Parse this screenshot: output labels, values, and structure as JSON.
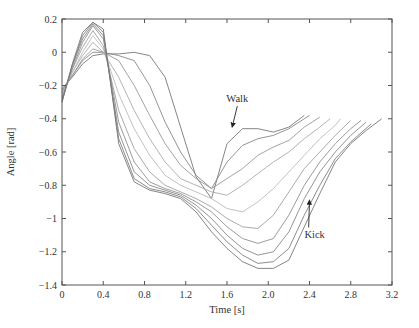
{
  "chart_data": {
    "type": "line",
    "title": "",
    "xlabel": "Time [s]",
    "ylabel": "Angle [rad]",
    "xlim": [
      0,
      3.2
    ],
    "ylim": [
      -1.4,
      0.2
    ],
    "xticks": [
      0,
      0.4,
      0.8,
      1.2,
      1.6,
      2.0,
      2.4,
      2.8,
      3.2
    ],
    "xtick_labels": [
      "0",
      "0.4",
      "0.8",
      "1.2",
      "1.6",
      "2.0",
      "2.4",
      "2.8",
      "3.2"
    ],
    "yticks": [
      0.2,
      0,
      -0.2,
      -0.4,
      -0.6,
      -0.8,
      -1,
      -1.2,
      -1.4
    ],
    "ytick_labels": [
      "0.2",
      "0",
      "−0.2",
      "−0.4",
      "−0.6",
      "−0.8",
      "−1",
      "−1.2",
      "−1.4"
    ],
    "grid": false,
    "legend": null,
    "line_color": "#8a8a8a",
    "annotations": [
      {
        "text": "Walk",
        "x_text": 1.7,
        "y_text": -0.3,
        "arrow_to": [
          1.65,
          -0.45
        ]
      },
      {
        "text": "Kick",
        "x_text": 2.45,
        "y_text": -1.12,
        "arrow_to": [
          2.4,
          -0.89
        ]
      }
    ],
    "series": [
      {
        "name": "Walk",
        "x": [
          0,
          0.1,
          0.2,
          0.3,
          0.4,
          0.55,
          0.7,
          0.85,
          1.0,
          1.15,
          1.3,
          1.45,
          1.6,
          1.75,
          1.9,
          2.05,
          2.2,
          2.35
        ],
        "y": [
          -0.22,
          -0.15,
          -0.07,
          -0.02,
          -0.01,
          -0.01,
          0.0,
          -0.02,
          -0.15,
          -0.45,
          -0.75,
          -0.88,
          -0.55,
          -0.46,
          -0.46,
          -0.48,
          -0.45,
          -0.38
        ]
      },
      {
        "name": "trial-2",
        "x": [
          0,
          0.1,
          0.2,
          0.3,
          0.4,
          0.55,
          0.7,
          0.85,
          1.0,
          1.15,
          1.3,
          1.45,
          1.6,
          1.75,
          1.9,
          2.05,
          2.2,
          2.4
        ],
        "y": [
          -0.23,
          -0.14,
          -0.05,
          0.0,
          0.0,
          -0.02,
          -0.05,
          -0.2,
          -0.42,
          -0.6,
          -0.74,
          -0.82,
          -0.66,
          -0.56,
          -0.52,
          -0.5,
          -0.46,
          -0.38
        ]
      },
      {
        "name": "trial-3",
        "x": [
          0,
          0.1,
          0.2,
          0.3,
          0.4,
          0.55,
          0.7,
          0.85,
          1.0,
          1.15,
          1.3,
          1.45,
          1.6,
          1.75,
          1.9,
          2.05,
          2.2,
          2.35,
          2.5
        ],
        "y": [
          -0.24,
          -0.14,
          -0.04,
          0.02,
          0.0,
          -0.05,
          -0.2,
          -0.38,
          -0.55,
          -0.68,
          -0.76,
          -0.82,
          -0.76,
          -0.7,
          -0.62,
          -0.57,
          -0.53,
          -0.45,
          -0.39
        ]
      },
      {
        "name": "trial-4",
        "x": [
          0,
          0.1,
          0.2,
          0.3,
          0.4,
          0.55,
          0.7,
          0.85,
          1.0,
          1.15,
          1.3,
          1.45,
          1.6,
          1.75,
          1.9,
          2.05,
          2.2,
          2.35,
          2.5,
          2.6
        ],
        "y": [
          -0.25,
          -0.12,
          -0.02,
          0.06,
          0.0,
          -0.15,
          -0.35,
          -0.52,
          -0.66,
          -0.76,
          -0.8,
          -0.84,
          -0.86,
          -0.8,
          -0.73,
          -0.66,
          -0.6,
          -0.52,
          -0.45,
          -0.4
        ]
      },
      {
        "name": "trial-5",
        "x": [
          0,
          0.1,
          0.2,
          0.3,
          0.4,
          0.55,
          0.7,
          0.85,
          1.0,
          1.15,
          1.3,
          1.45,
          1.6,
          1.75,
          1.9,
          2.05,
          2.2,
          2.35,
          2.5,
          2.65,
          2.7
        ],
        "y": [
          -0.26,
          -0.12,
          0.0,
          0.1,
          0.02,
          -0.25,
          -0.46,
          -0.62,
          -0.74,
          -0.8,
          -0.84,
          -0.88,
          -0.94,
          -0.96,
          -0.9,
          -0.82,
          -0.72,
          -0.62,
          -0.52,
          -0.44,
          -0.4
        ]
      },
      {
        "name": "trial-6",
        "x": [
          0,
          0.1,
          0.2,
          0.3,
          0.4,
          0.55,
          0.7,
          0.85,
          1.0,
          1.15,
          1.3,
          1.45,
          1.6,
          1.75,
          1.9,
          2.05,
          2.2,
          2.35,
          2.5,
          2.65,
          2.8
        ],
        "y": [
          -0.27,
          -0.1,
          0.03,
          0.13,
          0.04,
          -0.35,
          -0.58,
          -0.72,
          -0.8,
          -0.84,
          -0.88,
          -0.93,
          -1.0,
          -1.05,
          -1.06,
          -0.98,
          -0.84,
          -0.7,
          -0.6,
          -0.5,
          -0.41
        ]
      },
      {
        "name": "trial-7",
        "x": [
          0,
          0.1,
          0.2,
          0.3,
          0.4,
          0.55,
          0.7,
          0.85,
          1.0,
          1.15,
          1.3,
          1.45,
          1.6,
          1.75,
          1.9,
          2.05,
          2.2,
          2.35,
          2.5,
          2.65,
          2.8,
          2.9
        ],
        "y": [
          -0.28,
          -0.1,
          0.06,
          0.16,
          0.08,
          -0.42,
          -0.66,
          -0.78,
          -0.82,
          -0.85,
          -0.9,
          -0.96,
          -1.05,
          -1.12,
          -1.15,
          -1.12,
          -0.98,
          -0.8,
          -0.66,
          -0.55,
          -0.46,
          -0.41
        ]
      },
      {
        "name": "trial-8",
        "x": [
          0,
          0.1,
          0.2,
          0.3,
          0.4,
          0.55,
          0.7,
          0.85,
          1.0,
          1.15,
          1.3,
          1.45,
          1.6,
          1.75,
          1.9,
          2.05,
          2.2,
          2.35,
          2.5,
          2.65,
          2.8,
          2.95
        ],
        "y": [
          -0.29,
          -0.08,
          0.08,
          0.17,
          0.1,
          -0.48,
          -0.72,
          -0.8,
          -0.83,
          -0.86,
          -0.92,
          -1.0,
          -1.1,
          -1.18,
          -1.22,
          -1.2,
          -1.08,
          -0.88,
          -0.72,
          -0.6,
          -0.5,
          -0.42
        ]
      },
      {
        "name": "trial-9",
        "x": [
          0,
          0.1,
          0.2,
          0.3,
          0.4,
          0.55,
          0.7,
          0.85,
          1.0,
          1.15,
          1.3,
          1.45,
          1.6,
          1.75,
          1.9,
          2.05,
          2.2,
          2.35,
          2.5,
          2.65,
          2.8,
          3.0
        ],
        "y": [
          -0.3,
          -0.08,
          0.1,
          0.18,
          0.12,
          -0.52,
          -0.76,
          -0.82,
          -0.84,
          -0.87,
          -0.94,
          -1.04,
          -1.14,
          -1.22,
          -1.27,
          -1.26,
          -1.18,
          -0.98,
          -0.8,
          -0.64,
          -0.54,
          -0.43
        ]
      },
      {
        "name": "Kick",
        "x": [
          0,
          0.1,
          0.2,
          0.3,
          0.4,
          0.55,
          0.7,
          0.85,
          1.0,
          1.15,
          1.3,
          1.45,
          1.6,
          1.75,
          1.9,
          2.05,
          2.2,
          2.35,
          2.5,
          2.65,
          2.8,
          2.95,
          3.1
        ],
        "y": [
          -0.3,
          -0.07,
          0.12,
          0.18,
          0.14,
          -0.55,
          -0.78,
          -0.83,
          -0.85,
          -0.88,
          -0.96,
          -1.08,
          -1.18,
          -1.26,
          -1.3,
          -1.3,
          -1.25,
          -1.05,
          -0.85,
          -0.66,
          -0.55,
          -0.47,
          -0.4
        ]
      }
    ]
  }
}
